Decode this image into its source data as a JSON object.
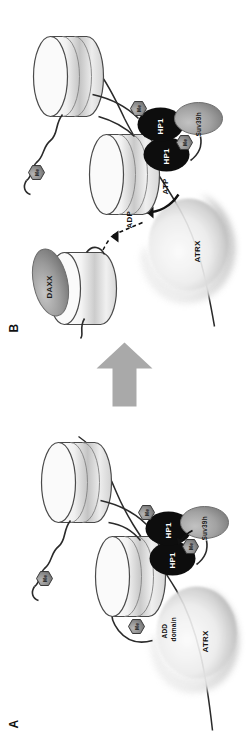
{
  "figure": {
    "type": "diagram",
    "orientation": "rotated-90-ccw",
    "background_color": "#ffffff",
    "transition_arrow": {
      "name": "transition-arrow",
      "direction": "right",
      "color": "#a9a9a9"
    }
  },
  "panels": [
    {
      "id": "A",
      "letter": "A",
      "description": "ATRX ADD domain bound to methylated histone tail on nucleosome with HP1 dimer and Suv39h",
      "elements": {
        "atrx": {
          "label": "ATRX",
          "color": "#e8e8e8",
          "shape": "crescent-blob"
        },
        "add_domain": {
          "label": "ADD\ndomain",
          "line1": "ADD",
          "line2": "domain"
        },
        "hp1_left": {
          "label": "HP1",
          "color": "#0d0d0d"
        },
        "hp1_right": {
          "label": "HP1",
          "color": "#0d0d0d"
        },
        "suv39h": {
          "label": "Suv39h",
          "color": "#a0a0a0"
        },
        "methyl_marks": [
          "Me",
          "Me",
          "Me",
          "Me"
        ]
      }
    },
    {
      "id": "B",
      "letter": "B",
      "description": "ATRX hydrolyses ATP to ADP to deposit DAXX-chaperoned histone variant onto nucleosome",
      "elements": {
        "atrx": {
          "label": "ATRX",
          "color": "#e8e8e8",
          "shape": "crescent-blob"
        },
        "daxx": {
          "label": "DAXX",
          "color": "#9a9a9a"
        },
        "atp": {
          "label": "ATP"
        },
        "adp": {
          "label": "ADP"
        },
        "hp1_left": {
          "label": "HP1",
          "color": "#0d0d0d"
        },
        "hp1_right": {
          "label": "HP1",
          "color": "#0d0d0d"
        },
        "suv39h": {
          "label": "Suv39h",
          "color": "#a0a0a0"
        },
        "methyl_marks": [
          "Me",
          "Me",
          "Me"
        ]
      }
    }
  ],
  "legend_text": {
    "methyl": "Me"
  }
}
